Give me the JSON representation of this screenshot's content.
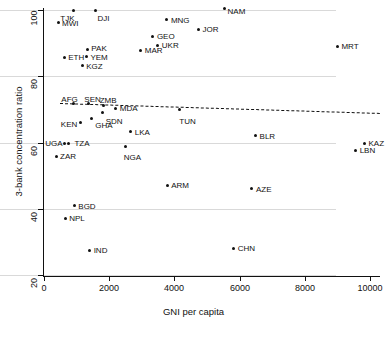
{
  "chart_data": {
    "type": "scatter",
    "title": "",
    "xlabel": "GNI per capita",
    "ylabel": "3-bank concentration ratio",
    "xlim": [
      -500,
      10300
    ],
    "ylim": [
      17,
      102
    ],
    "xticks": [
      0,
      2000,
      4000,
      6000,
      8000,
      10000
    ],
    "yticks": [
      20,
      40,
      60,
      80,
      100
    ],
    "grid": "horizontal",
    "legend": "none",
    "point_color": "#111111",
    "trendline": {
      "style": "dashed",
      "color": "#111111",
      "x_start": 500,
      "y_start": 71.8,
      "x_end": 10300,
      "y_end": 68.8
    },
    "points": [
      {
        "label": "TJK",
        "x": 900,
        "y": 100.0
      },
      {
        "label": "DJI",
        "x": 1580,
        "y": 100.0
      },
      {
        "label": "MWI",
        "x": 430,
        "y": 96.1
      },
      {
        "label": "MNG",
        "x": 3770,
        "y": 97.1
      },
      {
        "label": "NAM",
        "x": 5540,
        "y": 100.6
      },
      {
        "label": "JOR",
        "x": 4740,
        "y": 94.2
      },
      {
        "label": "GEO",
        "x": 3340,
        "y": 91.9
      },
      {
        "label": "UKR",
        "x": 3490,
        "y": 89.4
      },
      {
        "label": "MAR",
        "x": 2970,
        "y": 87.8
      },
      {
        "label": "MRT",
        "x": 9000,
        "y": 89.1
      },
      {
        "label": "PAK",
        "x": 1330,
        "y": 88.1
      },
      {
        "label": "YEM",
        "x": 1300,
        "y": 86.1
      },
      {
        "label": "ETH",
        "x": 620,
        "y": 85.8
      },
      {
        "label": "KGZ",
        "x": 1170,
        "y": 83.2
      },
      {
        "label": "AFG",
        "x": 900,
        "y": 71.9
      },
      {
        "label": "SEN",
        "x": 1360,
        "y": 71.9
      },
      {
        "label": "ZMB",
        "x": 1830,
        "y": 71.3
      },
      {
        "label": "MDA",
        "x": 2200,
        "y": 70.3
      },
      {
        "label": "SDN",
        "x": 1800,
        "y": 69.0
      },
      {
        "label": "TUN",
        "x": 4150,
        "y": 70.0
      },
      {
        "label": "KEN",
        "x": 1130,
        "y": 66.1
      },
      {
        "label": "GHA",
        "x": 1450,
        "y": 67.1
      },
      {
        "label": "LKA",
        "x": 2660,
        "y": 63.2
      },
      {
        "label": "BLR",
        "x": 6490,
        "y": 62.0
      },
      {
        "label": "KAZ",
        "x": 9830,
        "y": 59.7
      },
      {
        "label": "UGA",
        "x": 620,
        "y": 59.7
      },
      {
        "label": "TZA",
        "x": 750,
        "y": 59.7
      },
      {
        "label": "NGA",
        "x": 2510,
        "y": 58.7
      },
      {
        "label": "LBN",
        "x": 9560,
        "y": 57.7
      },
      {
        "label": "ZAR",
        "x": 370,
        "y": 55.8
      },
      {
        "label": "ARM",
        "x": 3780,
        "y": 47.1
      },
      {
        "label": "AZE",
        "x": 6380,
        "y": 46.1
      },
      {
        "label": "BGD",
        "x": 930,
        "y": 40.9
      },
      {
        "label": "NPL",
        "x": 650,
        "y": 37.1
      },
      {
        "label": "CHN",
        "x": 5820,
        "y": 28.1
      },
      {
        "label": "IND",
        "x": 1400,
        "y": 27.4
      }
    ],
    "label_offsets": {
      "TJK": {
        "dx": -13,
        "dy": 4
      },
      "DJI": {
        "dx": 2,
        "dy": 4
      },
      "MWI": {
        "dx": 4,
        "dy": -4
      },
      "MNG": {
        "dx": 4,
        "dy": -4
      },
      "NAM": {
        "dx": 3,
        "dy": -1
      },
      "JOR": {
        "dx": 4,
        "dy": -4
      },
      "GEO": {
        "dx": 4,
        "dy": -5
      },
      "UKR": {
        "dx": 4,
        "dy": -4
      },
      "MAR": {
        "dx": 4,
        "dy": -4
      },
      "MRT": {
        "dx": 4,
        "dy": -4
      },
      "PAK": {
        "dx": 4,
        "dy": -5
      },
      "YEM": {
        "dx": 4,
        "dy": -3
      },
      "ETH": {
        "dx": 4,
        "dy": -4
      },
      "KGZ": {
        "dx": 4,
        "dy": -4
      },
      "AFG": {
        "dx": -12,
        "dy": -8
      },
      "SEN": {
        "dx": -4,
        "dy": -8
      },
      "ZMB": {
        "dx": -4,
        "dy": -9
      },
      "MDA": {
        "dx": 4,
        "dy": -4
      },
      "SDN": {
        "dx": 3,
        "dy": 4
      },
      "TUN": {
        "dx": 0,
        "dy": 8
      },
      "KEN": {
        "dx": -20,
        "dy": -2
      },
      "GHA": {
        "dx": 4,
        "dy": 2
      },
      "LKA": {
        "dx": 4,
        "dy": -4
      },
      "BLR": {
        "dx": 4,
        "dy": -4
      },
      "KAZ": {
        "dx": 4,
        "dy": -4
      },
      "UGA": {
        "dx": -19,
        "dy": -4
      },
      "TZA": {
        "dx": 6,
        "dy": -4
      },
      "NGA": {
        "dx": -2,
        "dy": 6
      },
      "LBN": {
        "dx": 4,
        "dy": -4
      },
      "ZAR": {
        "dx": 4,
        "dy": -4
      },
      "ARM": {
        "dx": 4,
        "dy": -4
      },
      "AZE": {
        "dx": 4,
        "dy": -4
      },
      "BGD": {
        "dx": 4,
        "dy": -4
      },
      "NPL": {
        "dx": 4,
        "dy": -4
      },
      "CHN": {
        "dx": 4,
        "dy": -4
      },
      "IND": {
        "dx": 4,
        "dy": -4
      }
    }
  }
}
